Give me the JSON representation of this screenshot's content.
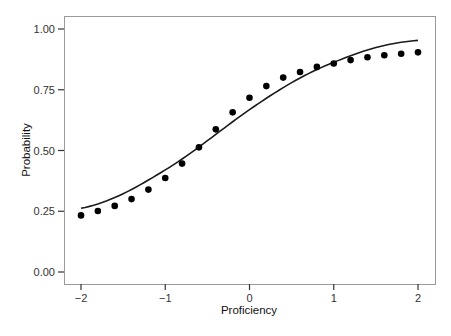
{
  "chart_data": {
    "type": "line",
    "title": "",
    "xlabel": "Proficiency",
    "ylabel": "Probability",
    "xlim": [
      -2.2,
      2.2
    ],
    "ylim": [
      -0.05,
      1.07
    ],
    "xticks": [
      -2,
      -1,
      0,
      1,
      2
    ],
    "xtick_labels": [
      "−2",
      "−1",
      "0",
      "1",
      "2"
    ],
    "yticks": [
      0,
      0.25,
      0.5,
      0.75,
      1.0
    ],
    "ytick_labels": [
      "0.00",
      "0.25",
      "0.50",
      "0.75",
      "1.00"
    ],
    "grid": false,
    "legend": null,
    "series": [
      {
        "name": "model curve",
        "kind": "line",
        "color": "#1a1a1a",
        "x": [
          -2,
          -1,
          0,
          1,
          2
        ],
        "y": [
          0.262,
          0.42,
          0.668,
          0.863,
          0.953
        ]
      },
      {
        "name": "observed",
        "kind": "scatter",
        "color": "#000000",
        "x": [
          -2.0,
          -1.8,
          -1.6,
          -1.4,
          -1.2,
          -1.0,
          -0.8,
          -0.6,
          -0.4,
          -0.2,
          0.0,
          0.2,
          0.4,
          0.6,
          0.8,
          1.0,
          1.2,
          1.4,
          1.6,
          1.8,
          2.0
        ],
        "y": [
          0.233,
          0.251,
          0.272,
          0.3,
          0.339,
          0.387,
          0.446,
          0.513,
          0.587,
          0.657,
          0.717,
          0.765,
          0.8,
          0.823,
          0.844,
          0.858,
          0.872,
          0.884,
          0.892,
          0.898,
          0.904
        ]
      }
    ]
  },
  "layout": {
    "plot_box": {
      "left": 64,
      "top": 16,
      "right": 435,
      "bottom": 284
    },
    "x_pixel": {
      "-2": 81,
      "2": 418
    },
    "y_pixel": {
      "0": 272,
      "1": 29
    }
  }
}
